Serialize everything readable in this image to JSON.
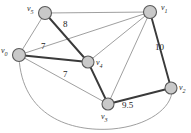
{
  "diagram": {
    "type": "graph",
    "canvas": {
      "width": 191,
      "height": 133,
      "background": "#ffffff"
    },
    "colors": {
      "node_fill": "#c9c9c9",
      "node_stroke": "#5a5a5a",
      "edge_thin": "#8e8e8e",
      "edge_thick": "#3a3a3a",
      "text": "#222222"
    },
    "vertices": [
      {
        "id": "v5",
        "name": "v",
        "subscript": "5",
        "x": 45,
        "y": 13,
        "r": 6.5,
        "label_x": 27,
        "label_y": 6
      },
      {
        "id": "v1",
        "name": "v",
        "subscript": "1",
        "x": 150,
        "y": 12,
        "r": 6.5,
        "label_x": 161,
        "label_y": 5
      },
      {
        "id": "v0",
        "name": "v",
        "subscript": "0",
        "x": 19,
        "y": 55,
        "r": 6.5,
        "label_x": 2,
        "label_y": 48
      },
      {
        "id": "v4",
        "name": "v",
        "subscript": "4",
        "x": 88,
        "y": 62,
        "r": 6,
        "label_x": 96,
        "label_y": 60
      },
      {
        "id": "v3",
        "name": "v",
        "subscript": "3",
        "x": 108,
        "y": 104,
        "r": 6,
        "label_x": 101,
        "label_y": 114
      },
      {
        "id": "v2",
        "name": "v",
        "subscript": "2",
        "x": 171,
        "y": 88,
        "r": 6,
        "label_x": 179,
        "label_y": 85
      }
    ],
    "edges": [
      {
        "id": "e-v5-v1",
        "from": "v5",
        "to": "v1",
        "style": "thin",
        "weight": null
      },
      {
        "id": "e-v5-v0",
        "from": "v5",
        "to": "v0",
        "style": "thin",
        "weight": null
      },
      {
        "id": "e-v5-v4",
        "from": "v5",
        "to": "v4",
        "style": "thick",
        "weight": "8"
      },
      {
        "id": "e-v0-v1",
        "from": "v0",
        "to": "v1",
        "style": "thin",
        "weight": null
      },
      {
        "id": "e-v0-v4",
        "from": "v0",
        "to": "v4",
        "style": "thick",
        "weight": "7"
      },
      {
        "id": "e-v0-v3",
        "from": "v0",
        "to": "v3",
        "style": "thin",
        "weight": "7"
      },
      {
        "id": "e-v1-v4",
        "from": "v1",
        "to": "v4",
        "style": "thin",
        "weight": null
      },
      {
        "id": "e-v1-v3",
        "from": "v1",
        "to": "v3",
        "style": "thin",
        "weight": null
      },
      {
        "id": "e-v1-v2",
        "from": "v1",
        "to": "v2",
        "style": "thick",
        "weight": "10"
      },
      {
        "id": "e-v4-v3",
        "from": "v4",
        "to": "v3",
        "style": "thick",
        "weight": null
      },
      {
        "id": "e-v3-v2",
        "from": "v3",
        "to": "v2",
        "style": "thick",
        "weight": "9.5"
      },
      {
        "id": "e-v0-v2-arc",
        "from": "v0",
        "to": "v2",
        "style": "thin",
        "weight": null,
        "curved": true
      }
    ],
    "weight_labels": [
      {
        "id": "w-8",
        "text": "8",
        "x": 65,
        "y": 24
      },
      {
        "id": "w-7-top",
        "text": "7",
        "x": 43,
        "y": 45
      },
      {
        "id": "w-7-bottom",
        "text": "7",
        "x": 65,
        "y": 73
      },
      {
        "id": "w-10",
        "text": "10",
        "x": 158,
        "y": 47
      },
      {
        "id": "w-9-5",
        "text": "9.5",
        "x": 124,
        "y": 104
      }
    ]
  }
}
